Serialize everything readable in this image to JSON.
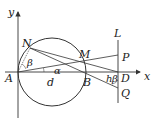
{
  "diagram": {
    "labels": {
      "y": "y",
      "x": "x",
      "N": "N",
      "M": "M",
      "L": "L",
      "P": "P",
      "A": "A",
      "B": "B",
      "D": "D",
      "Q": "Q",
      "d": "d",
      "alpha": "α",
      "beta1": "β",
      "beta2": "β",
      "h": "h"
    },
    "colors": {
      "line": "#333333",
      "bg": "#ffffff"
    }
  }
}
